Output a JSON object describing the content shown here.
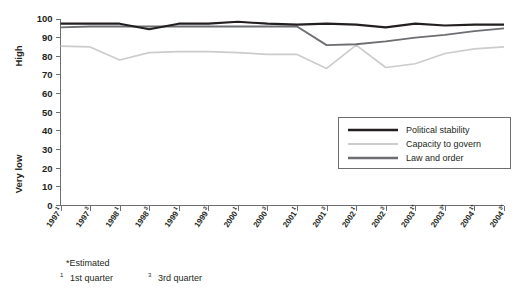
{
  "chart_data": {
    "type": "line",
    "title": "",
    "xlabel": "",
    "ylabel": "",
    "ylim": [
      0,
      100
    ],
    "grid": false,
    "legend_position": "center-right",
    "y_axis_top_label": "High",
    "y_axis_bottom_label": "Very low",
    "ytick_labels": [
      "0",
      "10",
      "20",
      "30",
      "40",
      "50",
      "60",
      "70",
      "80",
      "90",
      "100"
    ],
    "ytick_values": [
      0,
      10,
      20,
      30,
      40,
      50,
      60,
      70,
      80,
      90,
      100
    ],
    "categories": [
      "1997¹",
      "1997³",
      "1998¹",
      "1998³",
      "1999¹",
      "1999³",
      "2000¹",
      "2000³",
      "2001¹",
      "2001³",
      "2002¹",
      "2002³",
      "2003¹*",
      "2003³*",
      "2004¹*",
      "2004³*"
    ],
    "category_bases": [
      "1997",
      "1997",
      "1998",
      "1998",
      "1999",
      "1999",
      "2000",
      "2000",
      "2001",
      "2001",
      "2002",
      "2002",
      "2003",
      "2003",
      "2004",
      "2004"
    ],
    "category_sups": [
      "1",
      "3",
      "1",
      "3",
      "1",
      "3",
      "1",
      "3",
      "1",
      "3",
      "1",
      "3",
      "1*",
      "3*",
      "1*",
      "3*"
    ],
    "series": [
      {
        "name": "Political stability",
        "color": "#231f20",
        "values": [
          97.5,
          97.5,
          97.5,
          94.5,
          97.5,
          97.5,
          98.5,
          97.5,
          97,
          97.5,
          97,
          95.5,
          97.5,
          96.5,
          97,
          97
        ]
      },
      {
        "name": "Capacity to govern",
        "color": "#cccccc",
        "values": [
          85.5,
          85,
          78,
          82,
          82.5,
          82.5,
          82,
          81,
          81,
          73.5,
          86,
          74,
          76,
          81.5,
          84,
          85
        ]
      },
      {
        "name": "Law and order",
        "color": "#6d6e71",
        "values": [
          95.5,
          96,
          96,
          96,
          96,
          96,
          96,
          96,
          96,
          86,
          86.5,
          88,
          90,
          91.5,
          93.5,
          95
        ]
      }
    ]
  },
  "legend": {
    "items": [
      {
        "label": "Political stability",
        "color": "#231f20"
      },
      {
        "label": "Capacity to govern",
        "color": "#cccccc"
      },
      {
        "label": "Law and order",
        "color": "#6d6e71"
      }
    ]
  },
  "footnotes": {
    "estimated": "*Estimated",
    "q1_sup": "1",
    "q1_text": "1st quarter",
    "q3_sup": "3",
    "q3_text": "3rd quarter"
  }
}
